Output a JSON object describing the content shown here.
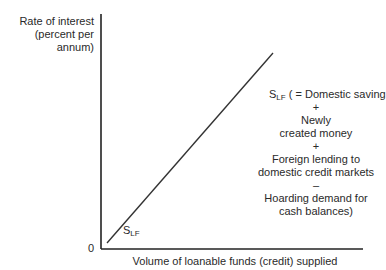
{
  "diagram": {
    "y_axis_label": [
      "Rate of interest",
      "(percent per",
      "annum)"
    ],
    "x_axis_label": "Volume of loanable funds (credit) supplied",
    "origin_label": "0",
    "curve": {
      "symbol": "S",
      "subscript": "LF",
      "lower_label": "S",
      "lower_label_subscript": "LF",
      "annotation_head": "( = Domestic saving",
      "annotation_lines": [
        "+",
        "Newly",
        "created money",
        "+",
        "Foreign lending to",
        "domestic credit markets",
        "–",
        "Hoarding demand for",
        "cash balances)"
      ]
    },
    "colors": {
      "axis": "#222222",
      "curve": "#333333",
      "text": "#2a2a2a"
    }
  }
}
